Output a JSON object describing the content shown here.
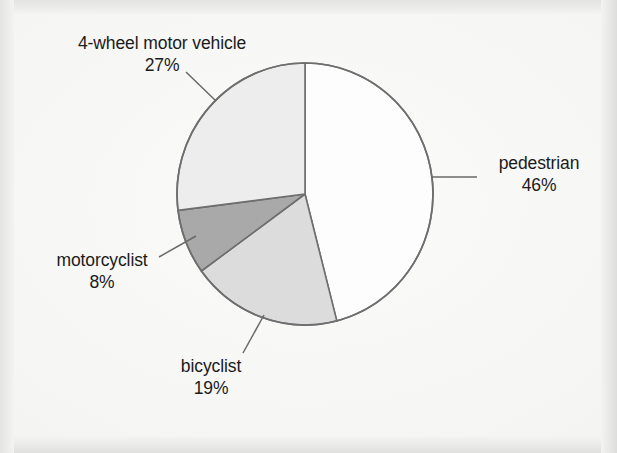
{
  "chart_data": {
    "type": "pie",
    "title": "",
    "subtitle": "",
    "xlabel": "",
    "ylabel": "",
    "legend_position": "none",
    "grid": false,
    "labels_outside": true,
    "categories": [
      "pedestrian",
      "bicyclist",
      "motorcyclist",
      "4-wheel motor vehicle"
    ],
    "values": [
      46,
      19,
      8,
      27
    ],
    "value_suffix": "%",
    "start_angle_deg": 0,
    "direction": "clockwise",
    "slices": [
      {
        "name": "pedestrian",
        "label": "pedestrian",
        "value": 46,
        "value_label": "46%",
        "fill": "#fdfdfd",
        "stroke": "#6e6e6e",
        "start_deg": 0,
        "end_deg": 165.6
      },
      {
        "name": "bicyclist",
        "label": "bicyclist",
        "value": 19,
        "value_label": "19%",
        "fill": "#dcdcdc",
        "stroke": "#6e6e6e",
        "start_deg": 165.6,
        "end_deg": 234.0
      },
      {
        "name": "motorcyclist",
        "label": "motorcyclist",
        "value": 8,
        "value_label": "8%",
        "fill": "#a9a9a9",
        "stroke": "#6e6e6e",
        "start_deg": 234.0,
        "end_deg": 262.8
      },
      {
        "name": "4-wheel motor vehicle",
        "label": "4-wheel motor vehicle",
        "value": 27,
        "value_label": "27%",
        "fill": "#ededed",
        "stroke": "#6e6e6e",
        "start_deg": 262.8,
        "end_deg": 360.0
      }
    ],
    "geometry": {
      "center_x": 305,
      "center_y": 194,
      "radius_x": 128,
      "radius_y": 131
    }
  },
  "labels": {
    "fourwheel": {
      "name": "4-wheel motor vehicle",
      "percent": "27%"
    },
    "pedestrian": {
      "name": "pedestrian",
      "percent": "46%"
    },
    "motorcyclist": {
      "name": "motorcyclist",
      "percent": "8%"
    },
    "bicyclist": {
      "name": "bicyclist",
      "percent": "19%"
    }
  },
  "colors": {
    "background": "#f3f3f2",
    "slice_pedestrian": "#fdfdfd",
    "slice_bicyclist": "#dcdcdc",
    "slice_motorcyclist": "#a9a9a9",
    "slice_fourwheel": "#ededed",
    "outline": "#6e6e6e",
    "leader_line": "#6a6a6a",
    "text": "#1b1b1b"
  }
}
